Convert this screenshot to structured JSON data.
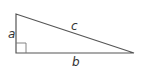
{
  "diagram": {
    "labels": {
      "a": "a",
      "b": "b",
      "c": "c"
    },
    "colors": {
      "stroke": "#555555",
      "label": "#333333",
      "background": "#ffffff"
    },
    "vertices": {
      "top": [
        16,
        14
      ],
      "right_angle": [
        16,
        53
      ],
      "far": [
        134,
        53
      ]
    }
  }
}
